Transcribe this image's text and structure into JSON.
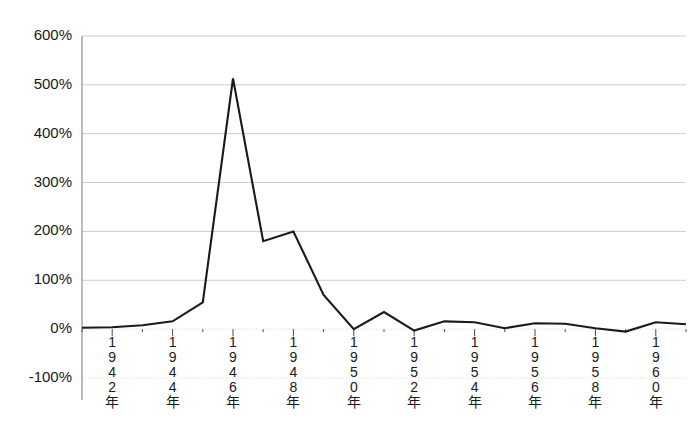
{
  "chart_data": {
    "type": "line",
    "title": "",
    "subtitle": "",
    "xlabel": "",
    "ylabel": "",
    "grid": true,
    "legend": false,
    "legend_position": "none",
    "line_color": "#1a1a1a",
    "grid_color": "#bfbfbf",
    "axis_color": "#7a7a7a",
    "background_color": "#ffffff",
    "ylim": [
      -100,
      600
    ],
    "ytick_values": [
      600,
      500,
      400,
      300,
      200,
      100,
      0,
      -100
    ],
    "ytick_labels": [
      "600%",
      "500%",
      "400%",
      "300%",
      "200%",
      "100%",
      "0%",
      "-100%"
    ],
    "xlim": [
      1941,
      1961
    ],
    "xtick_values": [
      1942,
      1944,
      1946,
      1948,
      1950,
      1952,
      1954,
      1956,
      1958,
      1960
    ],
    "xtick_labels": [
      "1942年",
      "1944年",
      "1946年",
      "1948年",
      "1950年",
      "1952年",
      "1954年",
      "1956年",
      "1958年",
      "1960年"
    ],
    "xtick_label_orientation": "vertical-stacked-characters",
    "x": [
      1941,
      1942,
      1943,
      1944,
      1945,
      1946,
      1947,
      1948,
      1949,
      1950,
      1951,
      1952,
      1953,
      1954,
      1955,
      1956,
      1957,
      1958,
      1959,
      1960,
      1961
    ],
    "series": [
      {
        "name": "",
        "values": [
          3,
          4,
          8,
          16,
          55,
          513,
          180,
          200,
          70,
          0,
          35,
          -3,
          16,
          14,
          2,
          12,
          11,
          2,
          -5,
          14,
          10
        ],
        "unit": "%"
      }
    ],
    "annotations": []
  }
}
